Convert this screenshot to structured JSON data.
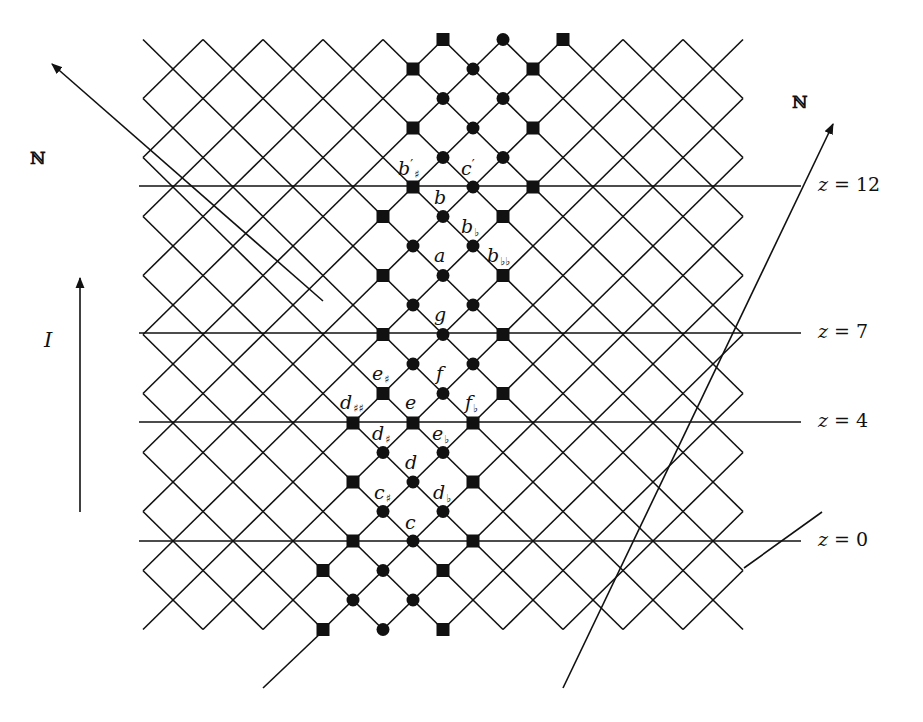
{
  "diagram": {
    "background": "#ffffff",
    "ink": "#111111",
    "lattice": {
      "origin_px": [
        413,
        541
      ],
      "step_x_px": 30,
      "step_y_px": 29.5,
      "i_range": [
        -9,
        11
      ],
      "j_range": [
        -3,
        17
      ]
    },
    "horizontal_lines": [
      {
        "z": 12,
        "label": "z = 12",
        "var": "z",
        "eq": " = 12",
        "y": 186,
        "x1": 139,
        "x2": 801
      },
      {
        "z": 7,
        "label": "z = 7",
        "var": "z",
        "eq": " = 7",
        "y": 333,
        "x1": 139,
        "x2": 801
      },
      {
        "z": 4,
        "label": "z = 4",
        "var": "z",
        "eq": " = 4",
        "y": 422,
        "x1": 139,
        "x2": 801
      },
      {
        "z": 0,
        "label": "z = 0",
        "var": "z",
        "eq": " = 0",
        "y": 541,
        "x1": 139,
        "x2": 801
      }
    ],
    "axes": [
      {
        "name": "N-axis-left",
        "label": "ℕ",
        "from": [
          323,
          301
        ],
        "to": [
          52,
          64
        ],
        "label_pos": [
          30,
          150
        ]
      },
      {
        "name": "N-axis-right",
        "label": "ℕ",
        "from": [
          563,
          688
        ],
        "to": [
          833,
          124
        ],
        "label_pos": [
          792,
          94
        ]
      },
      {
        "name": "I-axis",
        "label": "I",
        "from": [
          80,
          512
        ],
        "to": [
          80,
          278
        ],
        "label_pos": [
          44,
          330
        ]
      }
    ],
    "extra_lines": [
      {
        "from": [
          263,
          688
        ],
        "to": [
          324,
          630
        ]
      },
      {
        "from": [
          744,
          568
        ],
        "to": [
          822,
          512
        ]
      }
    ],
    "markers": [
      {
        "i": 1,
        "j": 17,
        "shape": "square"
      },
      {
        "i": 3,
        "j": 17,
        "shape": "circle"
      },
      {
        "i": 5,
        "j": 17,
        "shape": "square"
      },
      {
        "i": 0,
        "j": 16,
        "shape": "square"
      },
      {
        "i": 2,
        "j": 16,
        "shape": "circle"
      },
      {
        "i": 4,
        "j": 16,
        "shape": "square"
      },
      {
        "i": 1,
        "j": 15,
        "shape": "circle"
      },
      {
        "i": 3,
        "j": 15,
        "shape": "circle"
      },
      {
        "i": 0,
        "j": 14,
        "shape": "square"
      },
      {
        "i": 2,
        "j": 14,
        "shape": "circle"
      },
      {
        "i": 4,
        "j": 14,
        "shape": "square"
      },
      {
        "i": 1,
        "j": 13,
        "shape": "circle"
      },
      {
        "i": 3,
        "j": 13,
        "shape": "circle"
      },
      {
        "i": 0,
        "j": 12,
        "shape": "square"
      },
      {
        "i": 2,
        "j": 12,
        "shape": "circle"
      },
      {
        "i": 4,
        "j": 12,
        "shape": "square"
      },
      {
        "i": -1,
        "j": 11,
        "shape": "square"
      },
      {
        "i": 1,
        "j": 11,
        "shape": "circle"
      },
      {
        "i": 3,
        "j": 11,
        "shape": "square"
      },
      {
        "i": 0,
        "j": 10,
        "shape": "circle"
      },
      {
        "i": 2,
        "j": 10,
        "shape": "circle"
      },
      {
        "i": -1,
        "j": 9,
        "shape": "square"
      },
      {
        "i": 1,
        "j": 9,
        "shape": "circle"
      },
      {
        "i": 3,
        "j": 9,
        "shape": "square"
      },
      {
        "i": 0,
        "j": 8,
        "shape": "circle"
      },
      {
        "i": 2,
        "j": 8,
        "shape": "circle"
      },
      {
        "i": -1,
        "j": 7,
        "shape": "square"
      },
      {
        "i": 1,
        "j": 7,
        "shape": "circle"
      },
      {
        "i": 3,
        "j": 7,
        "shape": "square"
      },
      {
        "i": 0,
        "j": 6,
        "shape": "circle"
      },
      {
        "i": 2,
        "j": 6,
        "shape": "circle"
      },
      {
        "i": -1,
        "j": 5,
        "shape": "square"
      },
      {
        "i": 1,
        "j": 5,
        "shape": "circle"
      },
      {
        "i": 3,
        "j": 5,
        "shape": "square"
      },
      {
        "i": -2,
        "j": 4,
        "shape": "square"
      },
      {
        "i": 0,
        "j": 4,
        "shape": "square"
      },
      {
        "i": 2,
        "j": 4,
        "shape": "square"
      },
      {
        "i": -1,
        "j": 3,
        "shape": "circle"
      },
      {
        "i": 1,
        "j": 3,
        "shape": "circle"
      },
      {
        "i": -2,
        "j": 2,
        "shape": "square"
      },
      {
        "i": 0,
        "j": 2,
        "shape": "circle"
      },
      {
        "i": 2,
        "j": 2,
        "shape": "square"
      },
      {
        "i": -1,
        "j": 1,
        "shape": "circle"
      },
      {
        "i": 1,
        "j": 1,
        "shape": "circle"
      },
      {
        "i": -2,
        "j": 0,
        "shape": "square"
      },
      {
        "i": 0,
        "j": 0,
        "shape": "circle"
      },
      {
        "i": 2,
        "j": 0,
        "shape": "square"
      },
      {
        "i": -3,
        "j": -1,
        "shape": "square"
      },
      {
        "i": -1,
        "j": -1,
        "shape": "circle"
      },
      {
        "i": 1,
        "j": -1,
        "shape": "square"
      },
      {
        "i": -2,
        "j": -2,
        "shape": "circle"
      },
      {
        "i": 0,
        "j": -2,
        "shape": "circle"
      },
      {
        "i": -3,
        "j": -3,
        "shape": "square"
      },
      {
        "i": -1,
        "j": -3,
        "shape": "circle"
      },
      {
        "i": 1,
        "j": -3,
        "shape": "square"
      }
    ],
    "note_labels": [
      {
        "name": "b-prime-sharp",
        "base": "b",
        "sup": "′",
        "sub": "♯",
        "x": 398,
        "y": 158
      },
      {
        "name": "c-prime",
        "base": "c",
        "sup": "′",
        "sub": "",
        "x": 461,
        "y": 158
      },
      {
        "name": "b",
        "base": "b",
        "sup": "",
        "sub": "",
        "x": 434,
        "y": 188
      },
      {
        "name": "b-flat",
        "base": "b",
        "sup": "",
        "sub": "♭",
        "x": 461,
        "y": 217
      },
      {
        "name": "a",
        "base": "a",
        "sup": "",
        "sub": "",
        "x": 434,
        "y": 246
      },
      {
        "name": "b-double-flat",
        "base": "b",
        "sup": "",
        "sub": "♭♭",
        "x": 487,
        "y": 246
      },
      {
        "name": "g",
        "base": "g",
        "sup": "",
        "sub": "",
        "x": 434,
        "y": 305
      },
      {
        "name": "e-sharp",
        "base": "e",
        "sup": "",
        "sub": "♯",
        "x": 372,
        "y": 364
      },
      {
        "name": "f",
        "base": "f",
        "sup": "",
        "sub": "",
        "x": 436,
        "y": 364
      },
      {
        "name": "d-double-sharp",
        "base": "d",
        "sup": "",
        "sub": "♯♯",
        "x": 340,
        "y": 393
      },
      {
        "name": "e",
        "base": "e",
        "sup": "",
        "sub": "",
        "x": 405,
        "y": 393
      },
      {
        "name": "f-flat",
        "base": "f",
        "sup": "",
        "sub": "♭",
        "x": 465,
        "y": 393
      },
      {
        "name": "d-sharp",
        "base": "d",
        "sup": "",
        "sub": "♯",
        "x": 372,
        "y": 424
      },
      {
        "name": "e-flat",
        "base": "e",
        "sup": "",
        "sub": "♭",
        "x": 432,
        "y": 424
      },
      {
        "name": "d",
        "base": "d",
        "sup": "",
        "sub": "",
        "x": 405,
        "y": 453
      },
      {
        "name": "c-sharp",
        "base": "c",
        "sup": "",
        "sub": "♯",
        "x": 374,
        "y": 483
      },
      {
        "name": "d-flat",
        "base": "d",
        "sup": "",
        "sub": "♭",
        "x": 433,
        "y": 483
      },
      {
        "name": "c",
        "base": "c",
        "sup": "",
        "sub": "",
        "x": 405,
        "y": 513
      }
    ]
  }
}
